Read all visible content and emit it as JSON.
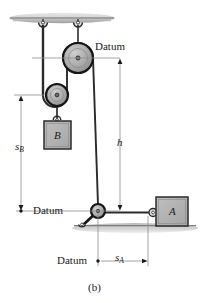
{
  "figure": {
    "caption": "(b)",
    "labels": {
      "datum_top": "Datum",
      "datum_middle": "Datum",
      "datum_bottom": "Datum",
      "block_b": "B",
      "block_a": "A",
      "dim_h": "h",
      "dim_sb_base": "s",
      "dim_sb_sub": "B",
      "dim_sa_base": "s",
      "dim_sa_sub": "A"
    },
    "colors": {
      "line": "#1a1a1a",
      "block_fill": "#b2b2b2",
      "pulley_fill": "#a8a8a8",
      "ceiling_fill": "#cfcfcf",
      "ground_fill": "#c9c9c9",
      "thin_line": "#7a7a7a",
      "background": "#ffffff"
    }
  }
}
